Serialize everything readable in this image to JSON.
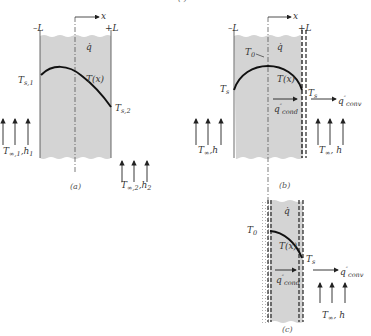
{
  "figure": {
    "header_fragment": "(   )",
    "panels": [
      {
        "id": "a",
        "caption": "(a)",
        "left_bound": "–L",
        "right_bound": "+L",
        "axis": "x",
        "generation": "q̇",
        "profile": "T(x)",
        "left_surface_temp": {
          "main": "T",
          "sub": "s,1"
        },
        "right_surface_temp": {
          "main": "T",
          "sub": "s,2"
        },
        "left_fluid": {
          "main": "T",
          "sub": "∞,1",
          "rest": ",h",
          "rest_sub": "1"
        },
        "right_fluid": {
          "main": "T",
          "sub": "∞,2",
          "rest": ",h",
          "rest_sub": "2"
        }
      },
      {
        "id": "b",
        "caption": "(b)",
        "left_bound": "–L",
        "right_bound": "+L",
        "axis": "x",
        "generation": "q̇",
        "profile": "T(x)",
        "center_temp": {
          "main": "T",
          "sub": "0"
        },
        "left_surface_temp": {
          "main": "T",
          "sub": "s"
        },
        "right_surface_temp": {
          "main": "T",
          "sub": "s"
        },
        "cond_flux": {
          "main": "q",
          "sup": "″",
          "sub": "cond"
        },
        "conv_flux": {
          "main": "q",
          "sup": "″",
          "sub": "conv"
        },
        "left_fluid": {
          "main": "T",
          "sub": "∞",
          "rest": ",h"
        },
        "right_fluid": {
          "main": "T",
          "sub": "∞",
          "rest": ", h"
        }
      },
      {
        "id": "c",
        "caption": "(c)",
        "generation": "q̇",
        "profile": "T(x)",
        "center_temp": {
          "main": "T",
          "sub": "0"
        },
        "right_surface_temp": {
          "main": "T",
          "sub": "s"
        },
        "cond_flux": {
          "main": "q",
          "sup": "″",
          "sub": "cond"
        },
        "conv_flux": {
          "main": "q",
          "sup": "″",
          "sub": "conv"
        },
        "right_fluid": {
          "main": "T",
          "sub": "∞",
          "rest": ", h"
        }
      }
    ],
    "colors": {
      "wall_fill": "#d4d4d4",
      "line": "#2a2a2a",
      "curve": "#111111"
    }
  }
}
